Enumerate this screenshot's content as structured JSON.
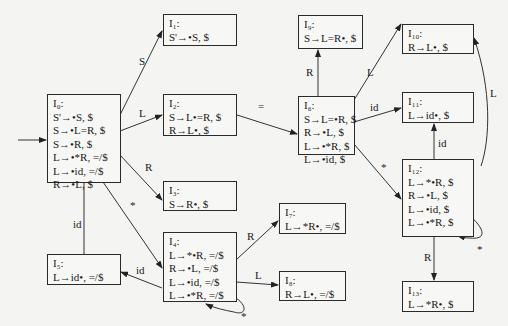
{
  "states": [
    {
      "id": "I0",
      "title": "I₀:",
      "items": [
        "S'→•S, $",
        "S→•L=R, $",
        "S→•R, $",
        "L→•*R, =/$",
        "L→•id, =/$",
        "R→•L, $"
      ]
    },
    {
      "id": "I1",
      "title": "I₁:",
      "items": [
        "S'→•S, $"
      ]
    },
    {
      "id": "I2",
      "title": "I₂:",
      "items": [
        "S→L•=R, $",
        "R→L•, $"
      ]
    },
    {
      "id": "I3",
      "title": "I₃:",
      "items": [
        "S→R•, $"
      ]
    },
    {
      "id": "I4",
      "title": "I₄:",
      "items": [
        "L→*•R, =/$",
        "R→•L, =/$",
        "L→•id, =/$",
        "L→•*R, =/$"
      ]
    },
    {
      "id": "I5",
      "title": "I₅:",
      "items": [
        "L→id•, =/$"
      ]
    },
    {
      "id": "I6",
      "title": "I₆:",
      "items": [
        "S→L=•R, $",
        "R→•L, $",
        "L→•*R, $",
        "L→•id, $"
      ]
    },
    {
      "id": "I7",
      "title": "I₇:",
      "items": [
        "L→*R•, =/$"
      ]
    },
    {
      "id": "I8",
      "title": "I₈:",
      "items": [
        "R→L•, =/$"
      ]
    },
    {
      "id": "I9",
      "title": "I₉:",
      "items": [
        "S→L=R•, $"
      ]
    },
    {
      "id": "I10",
      "title": "I₁₀:",
      "items": [
        "R→L•, $"
      ]
    },
    {
      "id": "I11",
      "title": "I₁₁:",
      "items": [
        "L→id•, $"
      ]
    },
    {
      "id": "I12",
      "title": "I₁₂:",
      "items": [
        "L→*•R, $",
        "R→•L, $",
        "L→•id, $",
        "L→•*R, $"
      ]
    },
    {
      "id": "I13",
      "title": "I₁₃:",
      "items": [
        "L→*R•, $"
      ]
    }
  ],
  "edges": [
    {
      "from": "I0",
      "to": "I1",
      "label": "S"
    },
    {
      "from": "I0",
      "to": "I2",
      "label": "L"
    },
    {
      "from": "I0",
      "to": "I3",
      "label": "R"
    },
    {
      "from": "I0",
      "to": "I4",
      "label": "*"
    },
    {
      "from": "I0",
      "to": "I5",
      "label": "id"
    },
    {
      "from": "I2",
      "to": "I6",
      "label": "="
    },
    {
      "from": "I4",
      "to": "I5",
      "label": "id"
    },
    {
      "from": "I4",
      "to": "I7",
      "label": "R"
    },
    {
      "from": "I4",
      "to": "I8",
      "label": "L"
    },
    {
      "from": "I4",
      "to": "I4",
      "label": "*"
    },
    {
      "from": "I6",
      "to": "I9",
      "label": "R"
    },
    {
      "from": "I6",
      "to": "I10",
      "label": "L"
    },
    {
      "from": "I6",
      "to": "I11",
      "label": "id"
    },
    {
      "from": "I6",
      "to": "I12",
      "label": "*"
    },
    {
      "from": "I12",
      "to": "I10",
      "label": "L"
    },
    {
      "from": "I12",
      "to": "I11",
      "label": "id"
    },
    {
      "from": "I12",
      "to": "I13",
      "label": "R"
    },
    {
      "from": "I12",
      "to": "I12",
      "label": "*"
    }
  ]
}
